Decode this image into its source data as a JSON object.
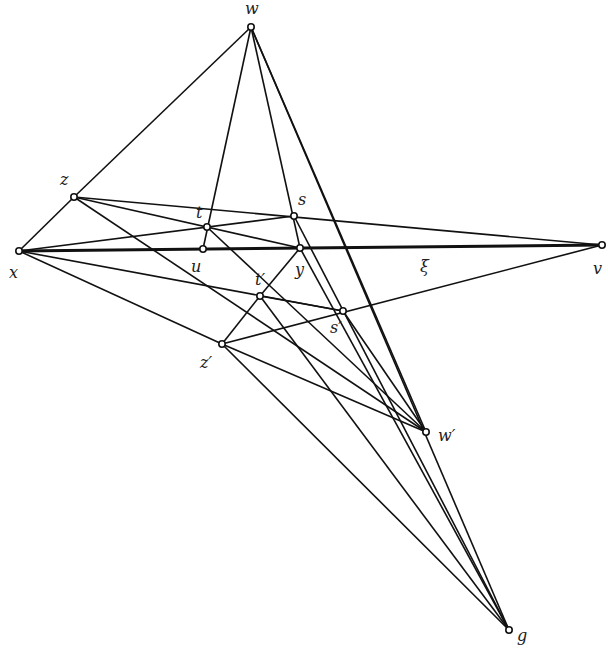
{
  "diagram": {
    "points": [
      {
        "id": "w",
        "label": "w",
        "x": 251,
        "y": 27,
        "lx": 245,
        "ly": 14
      },
      {
        "id": "z",
        "label": "z",
        "x": 74,
        "y": 197,
        "lx": 60,
        "ly": 185
      },
      {
        "id": "x",
        "label": "x",
        "x": 19,
        "y": 251,
        "lx": 9,
        "ly": 278
      },
      {
        "id": "t",
        "label": "t",
        "x": 207,
        "y": 227,
        "lx": 196,
        "ly": 218
      },
      {
        "id": "u",
        "label": "u",
        "x": 203,
        "y": 249,
        "lx": 191,
        "ly": 272
      },
      {
        "id": "s",
        "label": "s",
        "x": 294,
        "y": 216,
        "lx": 298,
        "ly": 205
      },
      {
        "id": "y",
        "label": "y",
        "x": 300,
        "y": 248,
        "lx": 295,
        "ly": 275
      },
      {
        "id": "v",
        "label": "v",
        "x": 602,
        "y": 245,
        "lx": 593,
        "ly": 274
      },
      {
        "id": "t2",
        "label": "t′",
        "x": 260,
        "y": 296,
        "lx": 255,
        "ly": 285
      },
      {
        "id": "s2",
        "label": "s′",
        "x": 343,
        "y": 311,
        "lx": 330,
        "ly": 333
      },
      {
        "id": "z2",
        "label": "z′",
        "x": 222,
        "y": 344,
        "lx": 200,
        "ly": 368
      },
      {
        "id": "w2",
        "label": "w′",
        "x": 426,
        "y": 432,
        "lx": 438,
        "ly": 441
      },
      {
        "id": "g",
        "label": "g",
        "x": 509,
        "y": 630,
        "lx": 517,
        "ly": 641
      }
    ],
    "extra_labels": [
      {
        "id": "xi",
        "label": "ξ",
        "x": 420,
        "y": 272
      }
    ],
    "lines": [
      {
        "from": "x",
        "to": "v",
        "weight": "thick"
      },
      {
        "from": "w",
        "to": "z"
      },
      {
        "from": "w",
        "to": "u"
      },
      {
        "from": "w",
        "to": "y"
      },
      {
        "from": "w",
        "to": "w2"
      },
      {
        "from": "w",
        "to": "g"
      },
      {
        "from": "z",
        "to": "x"
      },
      {
        "from": "z",
        "to": "v"
      },
      {
        "from": "z",
        "to": "y"
      },
      {
        "from": "z",
        "to": "w2"
      },
      {
        "from": "x",
        "to": "s"
      },
      {
        "from": "x",
        "to": "s2"
      },
      {
        "from": "x",
        "to": "z2"
      },
      {
        "from": "z2",
        "to": "v"
      },
      {
        "from": "z2",
        "to": "w2"
      },
      {
        "from": "z2",
        "to": "t2"
      },
      {
        "from": "z2",
        "to": "g"
      },
      {
        "from": "t2",
        "to": "y"
      },
      {
        "from": "t2",
        "to": "s2"
      },
      {
        "from": "t2",
        "to": "g"
      },
      {
        "from": "t",
        "to": "w2"
      },
      {
        "from": "s",
        "to": "g"
      },
      {
        "from": "y",
        "to": "g"
      },
      {
        "from": "s2",
        "to": "w2"
      }
    ]
  }
}
